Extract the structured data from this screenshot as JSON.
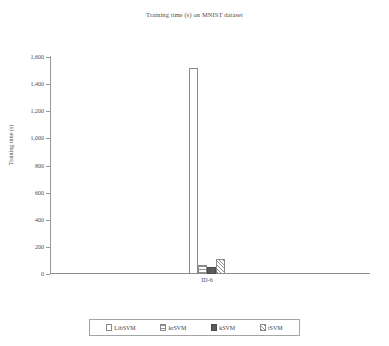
{
  "chart_data": {
    "type": "bar",
    "title": "Training time (s) on MNIST dataset",
    "xlabel": "",
    "ylabel": "Training time (s)",
    "categories": [
      "ID-6"
    ],
    "ylim": [
      0,
      1600
    ],
    "yticks": [
      "0",
      "200",
      "400",
      "600",
      "800",
      "1,000",
      "1,200",
      "1,400",
      "1,600"
    ],
    "ytick_values": [
      0,
      200,
      400,
      600,
      800,
      1000,
      1200,
      1400,
      1600
    ],
    "grid": false,
    "legend_position": "bottom",
    "series": [
      {
        "name": "LibSVM",
        "values": [
          1520
        ],
        "fill": "open-outline"
      },
      {
        "name": "krSVM",
        "values": [
          70
        ],
        "fill": "horizontal-lines"
      },
      {
        "name": "kSVM",
        "values": [
          50
        ],
        "fill": "solid-dark-gray"
      },
      {
        "name": "tSVM",
        "values": [
          110
        ],
        "fill": "diagonal-hatch"
      }
    ]
  },
  "colors": {
    "axis": "#8d8d8d",
    "text": "#4d4d4d",
    "bar_outline": "#8a8a8a",
    "bar_solid": "#5c5c5c",
    "background": "#ffffff"
  }
}
